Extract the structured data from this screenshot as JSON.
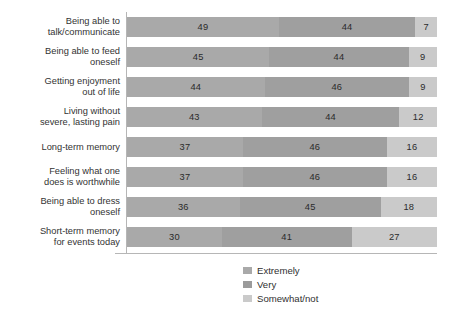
{
  "chart_data": {
    "type": "bar",
    "orientation": "horizontal",
    "stacked": true,
    "stack_mode": "percent",
    "title": "",
    "subtitle": "",
    "xlabel": "",
    "ylabel": "",
    "xlim": [
      0,
      100
    ],
    "grid": false,
    "legend_position": "bottom-center",
    "categories": [
      "Being able to talk/communicate",
      "Being able to feed oneself",
      "Getting enjoyment out of life",
      "Living without severe, lasting pain",
      "Long-term memory",
      "Feeling what one does is worthwhile",
      "Being able to dress oneself",
      "Short-term memory for events today"
    ],
    "category_lines": [
      [
        "Being able to",
        "talk/communicate"
      ],
      [
        "Being able to feed",
        "oneself"
      ],
      [
        "Getting enjoyment",
        "out of life"
      ],
      [
        "Living without",
        "severe, lasting pain"
      ],
      [
        "Long-term memory"
      ],
      [
        "Feeling what one",
        "does is worthwhile"
      ],
      [
        "Being able to dress",
        "oneself"
      ],
      [
        "Short-term memory",
        "for events today"
      ]
    ],
    "series": [
      {
        "name": "Extremely",
        "color": "#a9a9a9",
        "values": [
          49,
          45,
          44,
          43,
          37,
          37,
          36,
          30
        ]
      },
      {
        "name": "Very",
        "color": "#9f9f9f",
        "values": [
          44,
          44,
          46,
          44,
          46,
          46,
          45,
          41
        ]
      },
      {
        "name": "Somewhat/not",
        "color": "#cacaca",
        "values": [
          7,
          9,
          9,
          12,
          16,
          16,
          18,
          27
        ]
      }
    ]
  },
  "legend": {
    "items": [
      {
        "label": "Extremely",
        "color": "#a9a9a9"
      },
      {
        "label": "Very",
        "color": "#9b9b9b"
      },
      {
        "label": "Somewhat/not",
        "color": "#cacaca"
      }
    ]
  },
  "axis": {
    "line_color": "#b6b6b6"
  }
}
